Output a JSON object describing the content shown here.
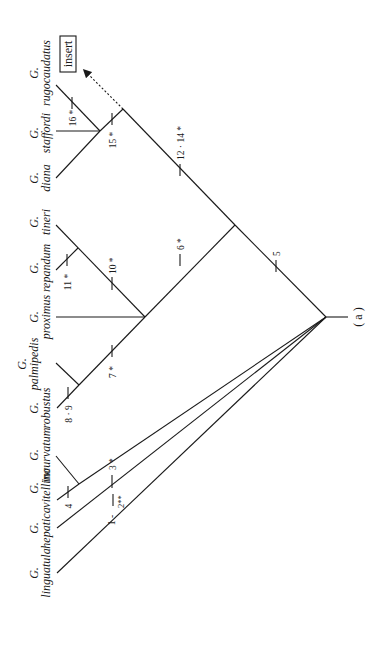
{
  "diagram": {
    "panel_label": "( a )",
    "insert_label": "insert",
    "taxa": [
      {
        "genus": "G.",
        "species": "linguatula"
      },
      {
        "genus": "G.",
        "species": "hepatica"
      },
      {
        "genus": "G.",
        "species": "vitellino"
      },
      {
        "genus": "G.",
        "species": "incurvatum"
      },
      {
        "genus": "G.",
        "species": "robustus"
      },
      {
        "genus": "G.",
        "species": "palmipedis"
      },
      {
        "genus": "G.",
        "species": "proximus"
      },
      {
        "genus": "G.",
        "species": "repandum"
      },
      {
        "genus": "G.",
        "species": "tineri"
      },
      {
        "genus": "G.",
        "species": "diana"
      },
      {
        "genus": "G.",
        "species": "staffordi"
      },
      {
        "genus": "G.",
        "species": "rugocaudatus"
      }
    ],
    "characters": {
      "c1_2": "1 -",
      "c1_2b": "2**",
      "c3": "3 *",
      "c4": "4",
      "c5": "5",
      "c6": "6 *",
      "c7": "7 *",
      "c8_9": "8 · 9",
      "c10": "10 *",
      "c11": "11 *",
      "c12_14": "12 · 14 *",
      "c15": "15 *",
      "c16": "16 *"
    }
  }
}
